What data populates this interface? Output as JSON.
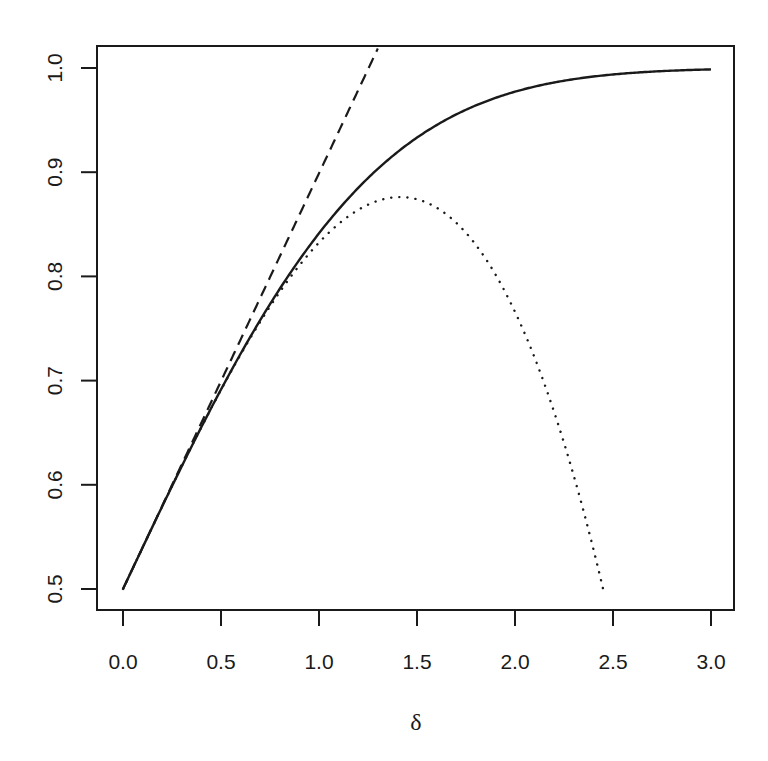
{
  "chart_data": {
    "type": "line",
    "title": "",
    "xlabel": "δ",
    "ylabel": "",
    "xlim": [
      0.0,
      3.0
    ],
    "ylim": [
      0.5,
      1.0
    ],
    "x_ticks": [
      "0.0",
      "0.5",
      "1.0",
      "1.5",
      "2.0",
      "2.5",
      "3.0"
    ],
    "y_ticks": [
      "0.5",
      "0.6",
      "0.7",
      "0.8",
      "0.9",
      "1.0"
    ],
    "grid": false,
    "legend": null,
    "series": [
      {
        "name": "exact",
        "style": "solid",
        "description": "Φ(δ), standard normal CDF",
        "x": [
          0.0,
          0.25,
          0.5,
          0.75,
          1.0,
          1.25,
          1.5,
          1.75,
          2.0,
          2.25,
          2.5,
          2.75,
          3.0
        ],
        "y": [
          0.5,
          0.599,
          0.691,
          0.773,
          0.841,
          0.894,
          0.933,
          0.96,
          0.977,
          0.988,
          0.994,
          0.997,
          0.999
        ]
      },
      {
        "name": "linear approximation",
        "style": "dashed",
        "description": "0.5 + δ/√(2π)",
        "x": [
          0.0,
          0.25,
          0.5,
          0.75,
          1.0,
          1.25,
          1.3
        ],
        "y": [
          0.5,
          0.6,
          0.699,
          0.799,
          0.899,
          0.999,
          1.019
        ]
      },
      {
        "name": "cubic approximation",
        "style": "dotted",
        "description": "0.5 + (δ − δ³/6)/√(2π)",
        "x": [
          0.0,
          0.25,
          0.5,
          0.75,
          1.0,
          1.25,
          1.414,
          1.5,
          1.75,
          2.0,
          2.25,
          2.449
        ],
        "y": [
          0.5,
          0.599,
          0.691,
          0.771,
          0.832,
          0.868,
          0.876,
          0.874,
          0.848,
          0.766,
          0.631,
          0.5
        ]
      }
    ]
  },
  "axes": {
    "x_label": "δ"
  }
}
